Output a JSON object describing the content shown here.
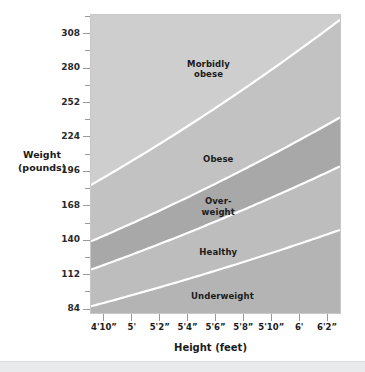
{
  "chart_data": {
    "type": "area",
    "title": "",
    "xlabel": "Height (feet)",
    "ylabel": "Weight\n(pounds)",
    "grid": false,
    "legend": "none",
    "x_tick_labels": [
      "4'10”",
      "5'",
      "5'2”",
      "5'4”",
      "5'6”",
      "5'8”",
      "5'10”",
      "6'",
      "6'2”"
    ],
    "x_tick_inches": [
      58,
      60,
      62,
      64,
      66,
      68,
      70,
      72,
      74
    ],
    "xlim_inches": [
      57,
      75
    ],
    "y_tick_labels": [
      "84",
      "112",
      "140",
      "168",
      "196",
      "224",
      "252",
      "280",
      "308"
    ],
    "y_tick_values": [
      84,
      112,
      140,
      168,
      196,
      224,
      252,
      280,
      308
    ],
    "y_minor_values": [
      98,
      126,
      154,
      182,
      210,
      238,
      266,
      294,
      322
    ],
    "ylim": [
      80,
      324
    ],
    "bands": [
      {
        "name": "Underweight",
        "label": "Underweight",
        "label_lines": [
          "Underweight"
        ],
        "bmi_range": [
          0,
          18.5
        ],
        "color": "#b4b4b4",
        "label_pos_inches": 66.5,
        "label_pos_pounds": 94
      },
      {
        "name": "Healthy",
        "label": "Healthy",
        "label_lines": [
          "Healthy"
        ],
        "bmi_range": [
          18.5,
          25
        ],
        "color": "#bdbdbd",
        "label_pos_inches": 66.2,
        "label_pos_pounds": 130
      },
      {
        "name": "Overweight",
        "label": "Over-weight",
        "label_lines": [
          "Over-",
          "weight"
        ],
        "bmi_range": [
          25,
          30
        ],
        "color": "#a8a8a8",
        "label_pos_inches": 66.2,
        "label_pos_pounds": 166
      },
      {
        "name": "Obese",
        "label": "Obese",
        "label_lines": [
          "Obese"
        ],
        "bmi_range": [
          30,
          40
        ],
        "color": "#c2c2c2",
        "label_pos_inches": 66.2,
        "label_pos_pounds": 205
      },
      {
        "name": "Morbidly obese",
        "label": "Morbidly obese",
        "label_lines": [
          "Morbidly",
          "obese"
        ],
        "bmi_range": [
          40,
          null
        ],
        "color": "#cecece",
        "label_pos_inches": 65.5,
        "label_pos_pounds": 278
      }
    ],
    "boundary_line_color": "#ffffff",
    "plot_background": "#d0d0d0",
    "plot_border_color": "#c8c8c8"
  },
  "axes": {
    "y_title": "Weight\n(pounds)",
    "x_title": "Height (feet)"
  }
}
